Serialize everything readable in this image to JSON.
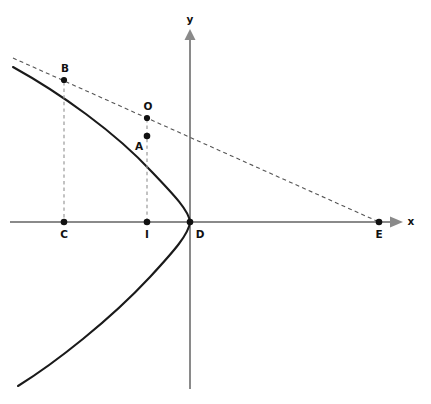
{
  "figure": {
    "kind": "geometry-diagram",
    "width": 431,
    "height": 404,
    "background_color": "#ffffff",
    "axes": {
      "x_axis_label": "x",
      "y_axis_label": "y",
      "axis_color": "#8a8a8a",
      "x_axis_y_px": 222,
      "y_axis_x_px": 190,
      "x_axis_start_px": 10,
      "x_axis_end_px": 402,
      "y_axis_top_px": 30,
      "y_axis_bottom_px": 389
    },
    "curve": {
      "name": "leftward-opening-parabola",
      "color": "#1a1a1a",
      "vertex_label": "D",
      "path": "M 13 67 Q 90 120 150 175 Q 185 205 190 222 Q 185 245 150 282 Q 80 345 18 386"
    },
    "tangent_line": {
      "name": "tangent-through-B-and-E",
      "color": "#555555",
      "style": "dashed",
      "from_px": [
        13,
        58
      ],
      "to_px": [
        379,
        222
      ]
    },
    "drop_lines": [
      {
        "name": "drop-line-B-to-C",
        "from_px": [
          64,
          80
        ],
        "to_px": [
          64,
          222
        ]
      },
      {
        "name": "drop-line-O-to-I",
        "from_px": [
          147,
          118
        ],
        "to_px": [
          147,
          222
        ]
      }
    ],
    "points": [
      {
        "id": "B",
        "label": "B",
        "x_px": 64,
        "y_px": 80,
        "label_x_px": 65,
        "label_y_px": 72,
        "on": "curve"
      },
      {
        "id": "O",
        "label": "O",
        "x_px": 147,
        "y_px": 118,
        "label_x_px": 148,
        "label_y_px": 109,
        "on": "tangent-line"
      },
      {
        "id": "A",
        "label": "A",
        "x_px": 147,
        "y_px": 136,
        "label_x_px": 139,
        "label_y_px": 149,
        "on": "curve"
      },
      {
        "id": "C",
        "label": "C",
        "x_px": 64,
        "y_px": 222,
        "label_x_px": 64,
        "label_y_px": 237,
        "on": "x-axis"
      },
      {
        "id": "I",
        "label": "I",
        "x_px": 147,
        "y_px": 222,
        "label_x_px": 147,
        "label_y_px": 237,
        "on": "x-axis"
      },
      {
        "id": "D",
        "label": "D",
        "x_px": 190,
        "y_px": 222,
        "label_x_px": 199,
        "label_y_px": 237,
        "on": "origin-vertex"
      },
      {
        "id": "E",
        "label": "E",
        "x_px": 379,
        "y_px": 222,
        "label_x_px": 379,
        "label_y_px": 237,
        "on": "x-axis"
      }
    ],
    "caption": {
      "text": "",
      "visible": false
    }
  }
}
